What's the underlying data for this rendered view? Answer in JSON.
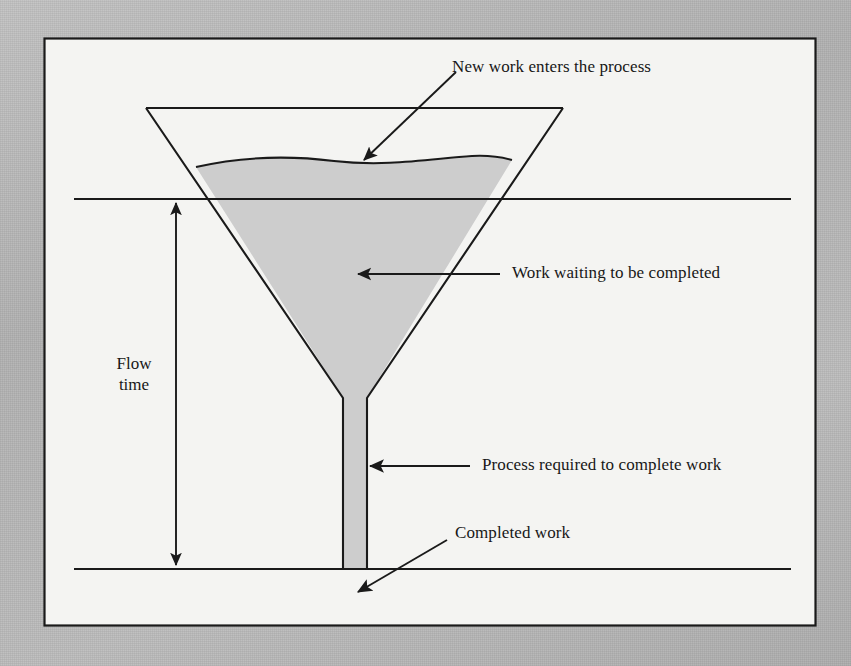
{
  "diagram": {
    "labels": {
      "new_work": "New work enters the process",
      "work_waiting": "Work waiting to be completed",
      "process_required": "Process required to complete work",
      "completed_work": "Completed work",
      "flow_time_line1": "Flow",
      "flow_time_line2": "time"
    },
    "colors": {
      "page_background": "#b9b9b9",
      "panel_background": "#f4f4f2",
      "panel_border": "#1a1a1a",
      "stroke": "#1a1a1a",
      "liquid_fill": "#cdcdcd",
      "neck_fill": "#cdcdcd",
      "text": "#171717"
    },
    "geometry": {
      "panel": {
        "x": 44,
        "y": 38,
        "width": 771,
        "height": 587
      },
      "funnel_top_left_x": 146,
      "funnel_top_right_x": 563,
      "funnel_top_y": 108,
      "funnel_cone_bottom_y": 398,
      "neck_left_x": 343,
      "neck_right_x": 367,
      "neck_bottom_y": 570,
      "liquid_surface_y": 163,
      "upper_reference_line_y": 199,
      "lower_reference_line_y": 569,
      "flow_time_arrow_x": 176
    }
  }
}
